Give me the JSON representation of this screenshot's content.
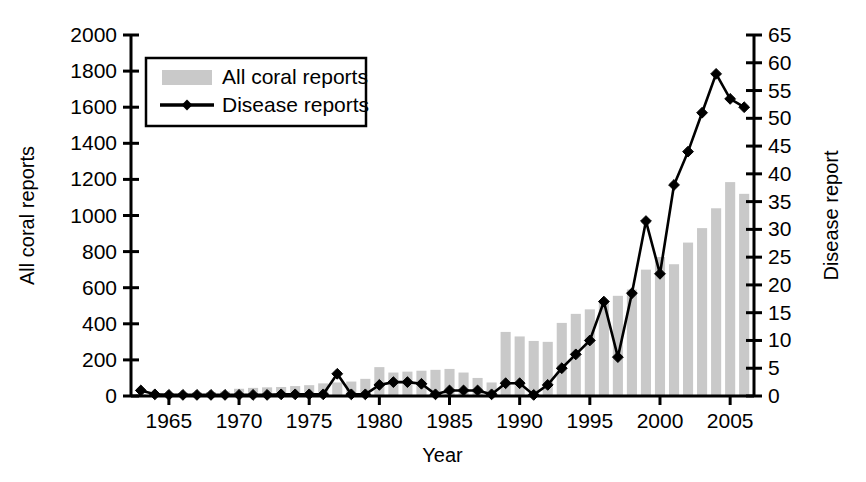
{
  "chart_data": {
    "type": "bar",
    "title": "",
    "xlabel": "Year",
    "ylabel": "All coral reports",
    "y2label": "Disease report",
    "xlim": [
      1962.3,
      2006.7
    ],
    "ylim": [
      0,
      2000
    ],
    "y2lim": [
      0,
      65
    ],
    "grid": false,
    "legend_position": "upper-left-inside",
    "x_ticks": [
      1965,
      1970,
      1975,
      1980,
      1985,
      1990,
      1995,
      2000,
      2005
    ],
    "y_ticks": [
      0,
      200,
      400,
      600,
      800,
      1000,
      1200,
      1400,
      1600,
      1800,
      2000
    ],
    "y2_ticks": [
      0,
      5,
      10,
      15,
      20,
      25,
      30,
      35,
      40,
      45,
      50,
      55,
      60,
      65
    ],
    "x": [
      1963,
      1964,
      1965,
      1966,
      1967,
      1968,
      1969,
      1970,
      1971,
      1972,
      1973,
      1974,
      1975,
      1976,
      1977,
      1978,
      1979,
      1980,
      1981,
      1982,
      1983,
      1984,
      1985,
      1986,
      1987,
      1988,
      1989,
      1990,
      1991,
      1992,
      1993,
      1994,
      1995,
      1996,
      1997,
      1998,
      1999,
      2000,
      2001,
      2002,
      2003,
      2004,
      2005,
      2006
    ],
    "series": [
      {
        "name": "All coral reports",
        "axis": "left",
        "type": "bar",
        "color": "#c9c9c9",
        "values": [
          10,
          12,
          15,
          18,
          20,
          22,
          25,
          40,
          45,
          48,
          50,
          55,
          60,
          70,
          75,
          80,
          95,
          160,
          130,
          135,
          140,
          145,
          150,
          130,
          100,
          75,
          355,
          330,
          305,
          300,
          405,
          455,
          480,
          520,
          555,
          590,
          700,
          770,
          730,
          850,
          930,
          1040,
          1185,
          1120
        ]
      },
      {
        "name": "Disease reports",
        "axis": "right",
        "type": "line",
        "color": "#000000",
        "marker": "diamond",
        "values": [
          1.0,
          0.3,
          0.2,
          0.2,
          0.2,
          0.2,
          0.2,
          0.2,
          0.2,
          0.2,
          0.3,
          0.3,
          0.3,
          0.3,
          4.0,
          0.3,
          0.3,
          2.0,
          2.5,
          2.5,
          2.2,
          0.3,
          1.0,
          1.0,
          1.0,
          0.3,
          2.3,
          2.3,
          0.2,
          2.0,
          5.0,
          7.5,
          10.0,
          17.0,
          7.0,
          18.5,
          31.5,
          22.0,
          38.0,
          44.0,
          51.0,
          58.0,
          53.5,
          52.0
        ]
      }
    ]
  },
  "legend": {
    "items": [
      {
        "label": "All coral reports",
        "marker": "swatch"
      },
      {
        "label": "Disease reports",
        "marker": "line-diamond"
      }
    ]
  },
  "axes": {
    "x_title": "Year",
    "y_left_title": "All coral reports",
    "y_right_title": "Disease report"
  }
}
